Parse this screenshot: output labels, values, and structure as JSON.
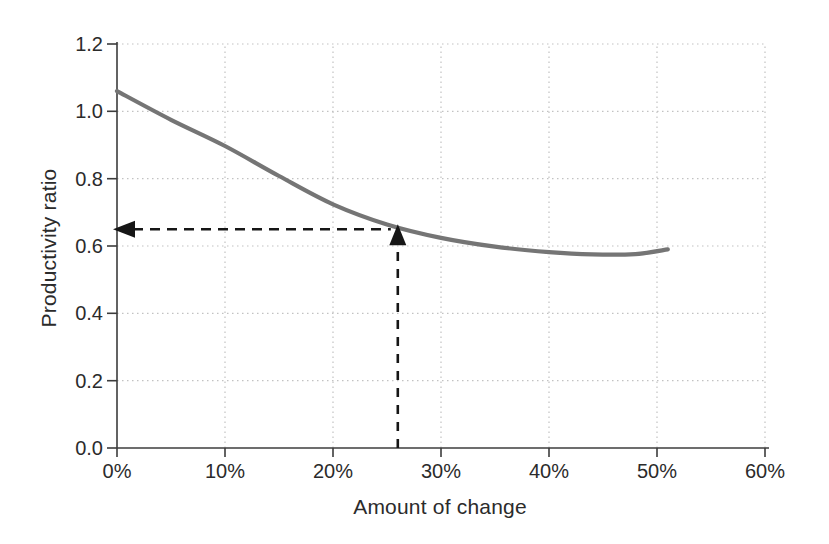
{
  "figure": {
    "width": 829,
    "height": 544,
    "background": "#ffffff"
  },
  "chart_data": {
    "type": "line",
    "title": "",
    "xlabel": "Amount of change",
    "ylabel": "Productivity ratio",
    "xlim": [
      0,
      60
    ],
    "ylim": [
      0,
      1.2
    ],
    "grid": "dotted",
    "grid_color": "#c2c2c2",
    "axis_color": "#3c3c3c",
    "text_color": "#2b2b2b",
    "x_ticks": {
      "values": [
        0,
        10,
        20,
        30,
        40,
        50,
        60
      ],
      "labels": [
        "0%",
        "10%",
        "20%",
        "30%",
        "40%",
        "50%",
        "60%"
      ]
    },
    "y_ticks": {
      "values": [
        0,
        0.2,
        0.4,
        0.6,
        0.8,
        1.0,
        1.2
      ],
      "labels": [
        "0.0",
        "0.2",
        "0.4",
        "0.6",
        "0.8",
        "1.0",
        "1.2"
      ]
    },
    "series": [
      {
        "name": "productivity-ratio-curve",
        "color": "#757575",
        "width": 4.2,
        "x": [
          0,
          5,
          10,
          15,
          20,
          25,
          30,
          35,
          40,
          44,
          48,
          51
        ],
        "y": [
          1.06,
          0.975,
          0.897,
          0.808,
          0.724,
          0.664,
          0.624,
          0.598,
          0.582,
          0.575,
          0.576,
          0.59
        ]
      }
    ],
    "annotation": {
      "name": "reference-marker",
      "x": 26,
      "y": 0.65,
      "style": "dashed-arrows",
      "color": "#161616"
    }
  }
}
